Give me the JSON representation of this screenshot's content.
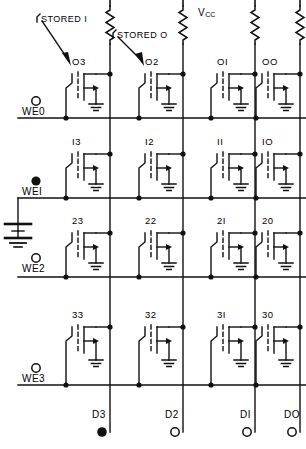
{
  "figure": {
    "type": "circuit-schematic",
    "supply_label": "V",
    "supply_sub": "CC"
  },
  "annotations": [
    {
      "name": "stored-one",
      "text": "STORED I"
    },
    {
      "name": "stored-zero",
      "text": "STORED O"
    }
  ],
  "columns": [
    {
      "id": "c3",
      "data_label": "D3",
      "data_state": "filled",
      "x": 110
    },
    {
      "id": "c2",
      "data_label": "D2",
      "data_state": "open",
      "x": 183
    },
    {
      "id": "c1",
      "data_label": "DI",
      "data_state": "open",
      "x": 255
    },
    {
      "id": "c0",
      "data_label": "DO",
      "data_state": "open",
      "x": 327
    }
  ],
  "rows": [
    {
      "id": "r0",
      "we_label": "WE0",
      "we_state": "open",
      "y": 118,
      "cells": [
        "O3",
        "O2",
        "OI",
        "OO"
      ]
    },
    {
      "id": "r1",
      "we_label": "WEI",
      "we_state": "filled",
      "y": 198,
      "cells": [
        "I3",
        "I2",
        "II",
        "IO"
      ]
    },
    {
      "id": "r2",
      "we_label": "WE2",
      "we_state": "open",
      "y": 277,
      "cells": [
        "23",
        "22",
        "2I",
        "20"
      ]
    },
    {
      "id": "r3",
      "we_label": "WE3",
      "we_state": "open",
      "y": 385,
      "cells": [
        "33",
        "32",
        "3I",
        "30"
      ]
    }
  ],
  "source": {
    "name": "battery-ground",
    "present": true
  },
  "colors": {
    "line": "#111111",
    "bg": "#ffffff"
  }
}
